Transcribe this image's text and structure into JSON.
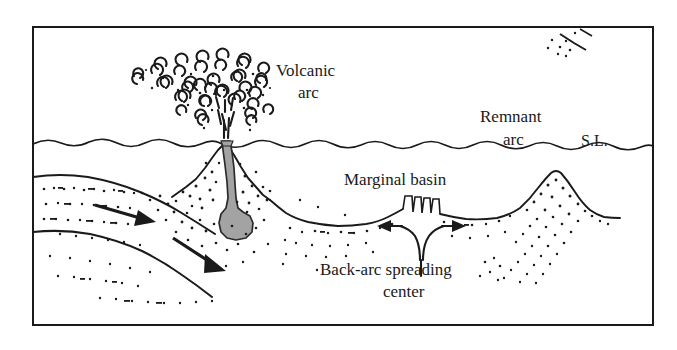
{
  "figure": {
    "type": "geologic-cross-section",
    "frame": {
      "x": 33,
      "y": 27,
      "width": 620,
      "height": 298,
      "stroke": "#1a1a1a"
    }
  },
  "labels": {
    "volcanic_arc_line1": "Volcanic",
    "volcanic_arc_line2": "arc",
    "remnant_arc_line1": "Remnant",
    "remnant_arc_line2": "arc",
    "sea_level": "S.L.",
    "marginal_basin": "Marginal basin",
    "back_arc_line1": "Back-arc spreading",
    "back_arc_line2": "center"
  },
  "colors": {
    "ink": "#1a1a1a",
    "magma_fill": "#a3a3a3",
    "magma_stroke": "#2b2b2b",
    "background": "#ffffff",
    "stipple": "#1a1a1a"
  },
  "features": {
    "sea_level_line": "wavy-horizontal-line",
    "volcanic_plume": "crescent-cloud-mushroom",
    "magma_conduit": "gray-filled-dike-with-chamber",
    "subducting_slab": "two-parallel-curved-lines-dipping-right",
    "slab_arrows": 2,
    "spreading_center": "graben-with-fault-blocks",
    "divergence_arrows": [
      "left",
      "right"
    ],
    "remnant_arc": "stippled-peak"
  }
}
